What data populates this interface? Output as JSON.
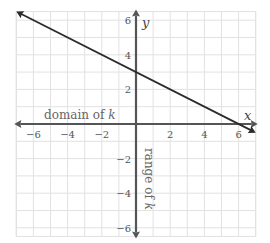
{
  "chart_data": {
    "type": "line",
    "title": "",
    "xlabel": "x",
    "ylabel": "y",
    "xlim": [
      -7,
      7
    ],
    "ylim": [
      -6.5,
      6.5
    ],
    "grid": true,
    "x_ticks": [
      -6,
      -4,
      -2,
      2,
      4,
      6
    ],
    "y_ticks": [
      6,
      4,
      2,
      -2,
      -4,
      -6
    ],
    "x_tick_labels": [
      "−6",
      "−4",
      "−2",
      "2",
      "4",
      "6"
    ],
    "y_tick_labels": [
      "6",
      "4",
      "2",
      "−2",
      "−4",
      "−6"
    ],
    "series": [
      {
        "name": "k",
        "equation": "y = -x/2 + 3",
        "x": [
          -7,
          0,
          6,
          7
        ],
        "y": [
          6.5,
          3,
          0,
          -0.5
        ],
        "arrows": "both"
      }
    ],
    "annotations": [
      {
        "text_main": "domain of ",
        "text_var": "k",
        "along": "x-axis"
      },
      {
        "text_main": "range of ",
        "text_var": "k",
        "along": "y-axis",
        "rotation": 90
      }
    ],
    "colors": {
      "line": "#2b2b2b",
      "axis": "#555555",
      "grid": "#e2e2e2"
    }
  }
}
